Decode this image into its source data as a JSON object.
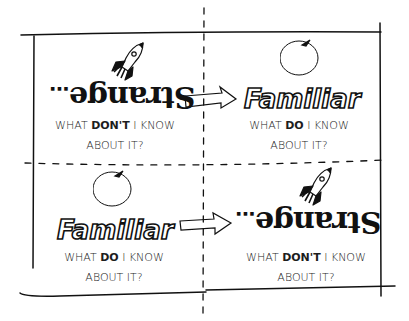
{
  "diagram": {
    "type": "2x2 quadrant concept sketch",
    "colors": {
      "ink": "#111111",
      "paper": "#ffffff"
    },
    "quadrants": [
      {
        "id": "top-left",
        "icon": "rocket-icon",
        "word": "Strange",
        "word_suffix": "...",
        "word_style": "upside-down mirrored",
        "question_pre": "WHAT ",
        "question_bold": "DON'T",
        "question_post": " I KNOW",
        "question_line2": "ABOUT IT?"
      },
      {
        "id": "top-right",
        "icon": "apple-icon",
        "word": "Familiar",
        "word_style": "outlined bubble letters",
        "question_pre": "WHAT ",
        "question_bold": "DO",
        "question_post": " I KNOW",
        "question_line2": "ABOUT IT?"
      },
      {
        "id": "bottom-left",
        "icon": "apple-icon",
        "word": "Familiar",
        "word_style": "outlined bubble letters",
        "question_pre": "WHAT ",
        "question_bold": "DO",
        "question_post": " I KNOW",
        "question_line2": "ABOUT IT?"
      },
      {
        "id": "bottom-right",
        "icon": "rocket-icon",
        "word": "Strange",
        "word_suffix": "...",
        "word_style": "upside-down mirrored",
        "question_pre": "WHAT ",
        "question_bold": "DON'T",
        "question_post": " I KNOW",
        "question_line2": "ABOUT IT?"
      }
    ],
    "arrows": [
      {
        "from": "top-left",
        "to": "top-right",
        "meaning": "Strange to Familiar"
      },
      {
        "from": "bottom-left",
        "to": "bottom-right",
        "meaning": "Familiar to Strange"
      }
    ]
  }
}
